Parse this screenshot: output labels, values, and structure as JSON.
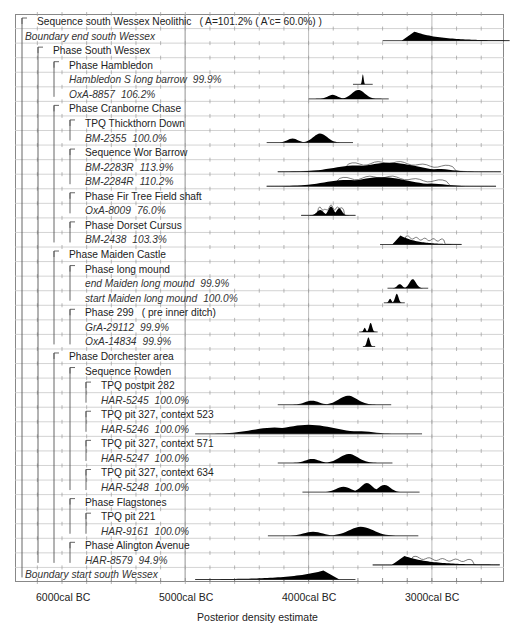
{
  "chart_data": {
    "type": "table",
    "subtype": "oxcal-multiplot-posterior-density",
    "title": "",
    "xlabel": "Posterior density estimate",
    "ylabel": "",
    "x_ticks": [
      {
        "label": "6000cal BC",
        "value": -6000
      },
      {
        "label": "5000cal BC",
        "value": -5000
      },
      {
        "label": "4000cal BC",
        "value": -4000
      },
      {
        "label": "3000cal BC",
        "value": -3000
      }
    ],
    "xlim": [
      -6400,
      -2400
    ],
    "grid": true,
    "rows": [
      {
        "label": "Sequence south Wessex Neolithic",
        "suffix": "( A=101.2% ( A'c= 60.0%) )",
        "indent": 0,
        "italic": false,
        "type": "group"
      },
      {
        "label": "Boundary end south Wessex",
        "indent": 0,
        "italic": true,
        "type": "boundary",
        "range": [
          -3400,
          -2370
        ],
        "peak": -3180,
        "shape": "skew-right"
      },
      {
        "label": "Phase South Wessex",
        "indent": 1,
        "italic": false,
        "type": "group"
      },
      {
        "label": "Phase Hambledon",
        "indent": 2,
        "italic": false,
        "type": "group"
      },
      {
        "label": "Hambledon S long barrow",
        "pct": "99.9%",
        "indent": 2,
        "italic": true,
        "type": "date",
        "range": [
          -3640,
          -3480
        ],
        "peak": -3570,
        "shape": "spike"
      },
      {
        "label": "OxA-8857",
        "pct": "106.2%",
        "indent": 2,
        "italic": true,
        "type": "date",
        "range": [
          -4000,
          -3350
        ],
        "peak": -3700,
        "shape": "bimodal"
      },
      {
        "label": "Phase Cranborne Chase",
        "indent": 2,
        "italic": false,
        "type": "group"
      },
      {
        "label": "TPQ Thickthorn Down",
        "indent": 3,
        "italic": false,
        "type": "group"
      },
      {
        "label": "BM-2355",
        "pct": "100.0%",
        "indent": 3,
        "italic": true,
        "type": "date",
        "range": [
          -4340,
          -3640
        ],
        "peak": -3950,
        "shape": "bimodal"
      },
      {
        "label": "Sequence Wor Barrow",
        "indent": 3,
        "italic": false,
        "type": "group"
      },
      {
        "label": "BM-2283R",
        "pct": "113.9%",
        "indent": 3,
        "italic": true,
        "type": "date",
        "range": [
          -4250,
          -2440
        ],
        "peak": -3400,
        "shape": "broad",
        "has_prior": true
      },
      {
        "label": "BM-2284R",
        "pct": "110.2%",
        "indent": 3,
        "italic": true,
        "type": "date",
        "range": [
          -4340,
          -2480
        ],
        "peak": -3620,
        "shape": "broad",
        "has_prior": true
      },
      {
        "label": "Phase Fir Tree Field shaft",
        "indent": 3,
        "italic": false,
        "type": "group"
      },
      {
        "label": "OxA-8009",
        "pct": "76.0%",
        "indent": 3,
        "italic": true,
        "type": "date",
        "range": [
          -4060,
          -3620
        ],
        "peak": -3760,
        "shape": "multi",
        "has_prior": true
      },
      {
        "label": "Phase Dorset Cursus",
        "indent": 3,
        "italic": false,
        "type": "group"
      },
      {
        "label": "BM-2438",
        "pct": "103.3%",
        "indent": 3,
        "italic": true,
        "type": "date",
        "range": [
          -3420,
          -2760
        ],
        "peak": -3240,
        "shape": "skew-right",
        "has_prior": true
      },
      {
        "label": "Phase Maiden Castle",
        "indent": 2,
        "italic": false,
        "type": "group"
      },
      {
        "label": "Phase long mound",
        "indent": 3,
        "italic": false,
        "type": "group"
      },
      {
        "label": "end Maiden long mound",
        "pct": "99.9%",
        "indent": 3,
        "italic": true,
        "type": "boundary",
        "range": [
          -3360,
          -3030
        ],
        "peak": -3300,
        "shape": "bimodal"
      },
      {
        "label": "start Maiden long mound",
        "pct": "100.0%",
        "indent": 3,
        "italic": true,
        "type": "boundary",
        "range": [
          -3390,
          -3220
        ],
        "peak": -3370,
        "shape": "bimodal"
      },
      {
        "label": "Phase 299",
        "suffix": "( pre inner ditch)",
        "indent": 3,
        "italic": false,
        "type": "group"
      },
      {
        "label": "GrA-29112",
        "pct": "99.9%",
        "indent": 3,
        "italic": true,
        "type": "date",
        "range": [
          -3590,
          -3440
        ],
        "peak": -3530,
        "shape": "bimodal"
      },
      {
        "label": "OxA-14834",
        "pct": "99.9%",
        "indent": 3,
        "italic": true,
        "type": "date",
        "range": [
          -3560,
          -3460
        ],
        "peak": -3530,
        "shape": "peak"
      },
      {
        "label": "Phase Dorchester area",
        "indent": 2,
        "italic": false,
        "type": "group"
      },
      {
        "label": "Sequence Rowden",
        "indent": 3,
        "italic": false,
        "type": "group"
      },
      {
        "label": "TPQ postpit 282",
        "indent": 4,
        "italic": false,
        "type": "group"
      },
      {
        "label": "HAR-5245",
        "pct": "100.0%",
        "indent": 4,
        "italic": true,
        "type": "date",
        "range": [
          -4250,
          -3330
        ],
        "peak": -3760,
        "shape": "bimodal"
      },
      {
        "label": "TPQ pit 327, context 523",
        "indent": 4,
        "italic": false,
        "type": "group"
      },
      {
        "label": "HAR-5246",
        "pct": "100.0%",
        "indent": 4,
        "italic": true,
        "type": "date",
        "range": [
          -4920,
          -3080
        ],
        "peak": -4100,
        "shape": "broad"
      },
      {
        "label": "TPQ pit 327, context 571",
        "indent": 4,
        "italic": false,
        "type": "group"
      },
      {
        "label": "HAR-5247",
        "pct": "100.0%",
        "indent": 4,
        "italic": true,
        "type": "date",
        "range": [
          -4250,
          -3320
        ],
        "peak": -3760,
        "shape": "bimodal"
      },
      {
        "label": "TPQ pit 327, context 634",
        "indent": 4,
        "italic": false,
        "type": "group"
      },
      {
        "label": "HAR-5248",
        "pct": "100.0%",
        "indent": 4,
        "italic": true,
        "type": "date",
        "range": [
          -4050,
          -3100
        ],
        "peak": -3650,
        "shape": "multi"
      },
      {
        "label": "Phase Flagstones",
        "indent": 3,
        "italic": false,
        "type": "group"
      },
      {
        "label": "TPQ pit 221",
        "indent": 4,
        "italic": false,
        "type": "group"
      },
      {
        "label": "HAR-9161",
        "pct": "100.0%",
        "indent": 4,
        "italic": true,
        "type": "date",
        "range": [
          -4330,
          -3110
        ],
        "peak": -3760,
        "shape": "bimodal"
      },
      {
        "label": "Phase Alington Avenue",
        "indent": 3,
        "italic": false,
        "type": "group"
      },
      {
        "label": "HAR-8579",
        "pct": "94.9%",
        "indent": 3,
        "italic": true,
        "type": "date",
        "range": [
          -3480,
          -2450
        ],
        "peak": -3240,
        "shape": "skew-right",
        "has_prior": true
      },
      {
        "label": "Boundary start south Wessex",
        "indent": 0,
        "italic": true,
        "type": "boundary",
        "range": [
          -4920,
          -3620
        ],
        "peak": -3810,
        "shape": "skew-left"
      }
    ]
  },
  "axis": {
    "tick_labels": [
      "6000cal BC",
      "5000cal BC",
      "4000cal BC",
      "3000cal BC"
    ],
    "title": "Posterior density estimate"
  },
  "colors": {
    "distribution_fill": "#000000",
    "prior_outline": "#444444",
    "grid": "#c8c8c8",
    "major_grid": "#aaaaaa",
    "border": "#888888",
    "text": "#222222"
  }
}
